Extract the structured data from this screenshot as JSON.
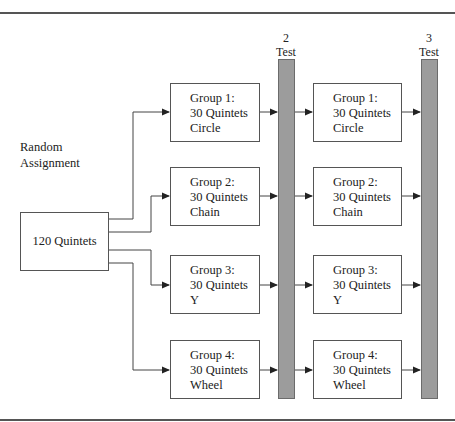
{
  "diagram": {
    "type": "experimental-design-flowchart",
    "assignment_label": [
      "Random",
      "Assignment"
    ],
    "source": {
      "label": "120 Quintets"
    },
    "tests": [
      {
        "number": "2",
        "label": "Test"
      },
      {
        "number": "3",
        "label": "Test"
      }
    ],
    "phase1_groups": [
      {
        "title": "Group 1:",
        "size": "30 Quintets",
        "network": "Circle"
      },
      {
        "title": "Group 2:",
        "size": "30 Quintets",
        "network": "Chain"
      },
      {
        "title": "Group 3:",
        "size": "30 Quintets",
        "network": "Y"
      },
      {
        "title": "Group 4:",
        "size": "30 Quintets",
        "network": "Wheel"
      }
    ],
    "phase2_groups": [
      {
        "title": "Group 1:",
        "size": "30 Quintets",
        "network": "Circle"
      },
      {
        "title": "Group 2:",
        "size": "30 Quintets",
        "network": "Chain"
      },
      {
        "title": "Group 3:",
        "size": "30 Quintets",
        "network": "Y"
      },
      {
        "title": "Group 4:",
        "size": "30 Quintets",
        "network": "Wheel"
      }
    ],
    "colors": {
      "test_bar_fill": "#9c9c9c",
      "line": "#333333",
      "box_border": "#555555"
    }
  }
}
